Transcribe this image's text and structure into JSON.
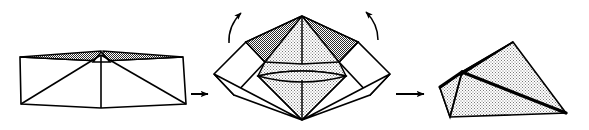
{
  "figure": {
    "background_color": "#ffffff",
    "stroke_color": "#000000",
    "fill_light": "#e8e8e8",
    "fill_dark": "#9a9a9a",
    "fill_white": "#ffffff",
    "width": 589,
    "height": 130
  },
  "stages": [
    {
      "id": "stage-1",
      "name": "flat-net",
      "caption": "",
      "description": "Flat unfolded net: wide rectangle with two crease diagonals meeting at an apex on the top edge and a thin shaded sliver band along the top",
      "bounds": {
        "x": 18,
        "y": 50,
        "width": 170,
        "height": 60
      }
    },
    {
      "id": "stage-2",
      "name": "partially-folded",
      "caption": "",
      "description": "Partially folded: side panels rotating upward, inner cone-like shaded surface visible, two dark shaded gores at upper left and upper right",
      "bounds": {
        "x": 212,
        "y": 12,
        "width": 180,
        "height": 110
      }
    },
    {
      "id": "stage-3",
      "name": "closed-solid",
      "caption": "",
      "description": "Closed tetrahedral solid with a bold fold ridge running from the left vertex to the lower right vertex",
      "bounds": {
        "x": 440,
        "y": 20,
        "width": 130,
        "height": 100
      }
    }
  ],
  "arrows": [
    {
      "id": "arrow-1",
      "name": "transition-arrow-1",
      "type": "straight",
      "direction": "right",
      "from_stage": "stage-1",
      "to_stage": "stage-2"
    },
    {
      "id": "arrow-2",
      "name": "transition-arrow-2",
      "type": "straight",
      "direction": "right",
      "from_stage": "stage-2",
      "to_stage": "stage-3"
    },
    {
      "id": "arrow-3",
      "name": "fold-motion-arrow-left",
      "type": "curved",
      "direction": "up-right",
      "attached_to": "stage-2"
    },
    {
      "id": "arrow-4",
      "name": "fold-motion-arrow-right",
      "type": "curved",
      "direction": "up-left",
      "attached_to": "stage-2"
    }
  ]
}
